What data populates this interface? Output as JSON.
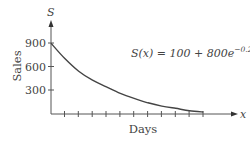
{
  "chart_data": {
    "type": "line",
    "title": "",
    "annotation": "S(x) = 100 + 800e^{-0.2x}",
    "xlabel": "Days",
    "ylabel": "Sales",
    "x_axis_var": "x",
    "y_axis_var": "S",
    "yticks": [
      300,
      600,
      900
    ],
    "ylim": [
      0,
      1000
    ],
    "x_tick_count": 11,
    "xlim": [
      0,
      12
    ],
    "grid": false,
    "legend": null,
    "x": [
      0,
      1,
      2,
      3,
      4,
      5,
      6,
      7,
      8,
      9,
      10,
      11
    ],
    "series": [
      {
        "name": "S(x)",
        "values": [
          900,
          705,
          544,
          430,
          345,
          262,
          199,
          143,
          101,
          72,
          42,
          25
        ]
      }
    ]
  },
  "labels": {
    "y_var": "S",
    "x_var": "x",
    "ylabel": "Sales",
    "xlabel": "Days",
    "tick_900": "900",
    "tick_600": "600",
    "tick_300": "300",
    "formula_lhs": "S(x) = 100 + 800",
    "formula_e": "e",
    "formula_exp": "−0.2x"
  },
  "colors": {
    "axis": "#555555",
    "curve": "#444444",
    "text": "#444444"
  }
}
